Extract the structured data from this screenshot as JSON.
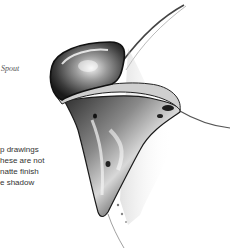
{
  "illustration": {
    "subject": "silver spout drawing",
    "label": "Spout",
    "caption_lines": [
      "p drawings",
      "hese are not",
      "natte finish",
      "e shadow"
    ]
  }
}
